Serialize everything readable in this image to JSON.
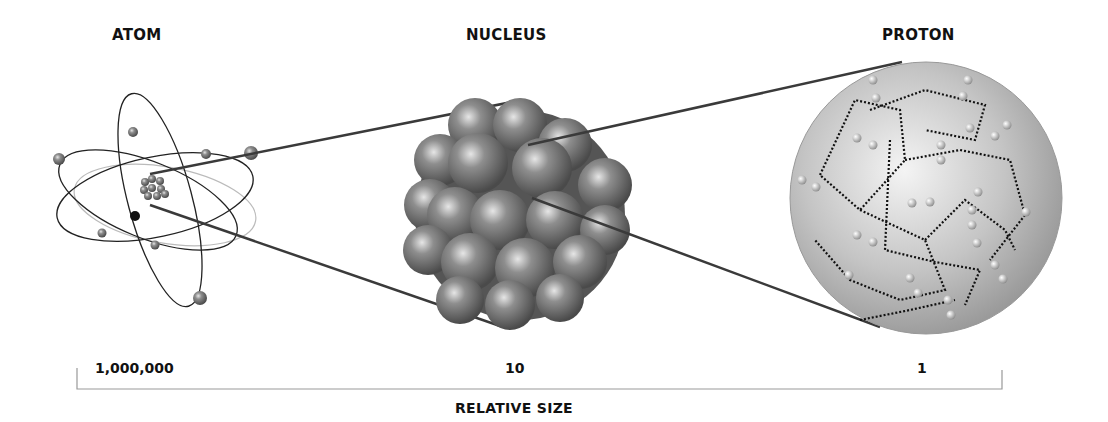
{
  "titles": {
    "atom": "ATOM",
    "nucleus": "NUCLEUS",
    "proton": "PROTON"
  },
  "scale": {
    "atom_value": "1,000,000",
    "nucleus_value": "10",
    "proton_value": "1",
    "axis_label": "RELATIVE SIZE"
  },
  "colors": {
    "line": "#3a3a3a",
    "sphere": "#8a8a8a",
    "proton_fill": "#c8c8c8",
    "bracket": "#999999"
  }
}
